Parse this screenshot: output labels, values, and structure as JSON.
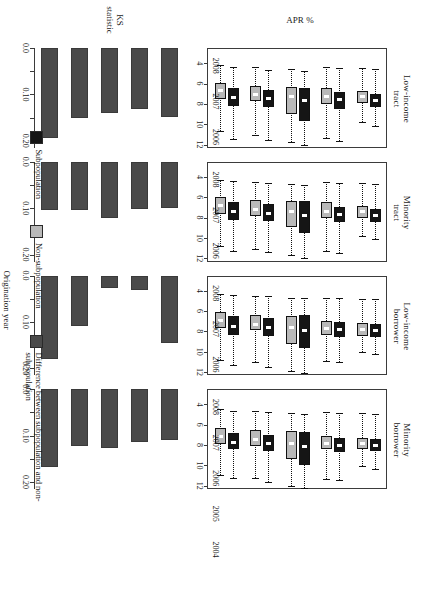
{
  "figure": {
    "orientation": "rotated-90",
    "apr_axis_label": "APR %",
    "ks_axis_label_line1": "KS",
    "ks_axis_label_line2": "statistic",
    "x_axis_label": "Origination year"
  },
  "legend": {
    "items": [
      {
        "label": "Subpopulation",
        "color": "#151515",
        "name": "subpopulation"
      },
      {
        "label": "Non-subpopulation",
        "color": "#b9b9b9",
        "name": "non-subpopulation"
      },
      {
        "label": "Difference between subpopulation and non-subpopulation",
        "color": "#4a4a4a",
        "name": "difference"
      }
    ]
  },
  "chart_data": {
    "type": "bar",
    "composite": "boxplot-over-bar, 4 column groups x 2 rows",
    "categories": [
      "2004",
      "2005",
      "2006",
      "2007",
      "2008"
    ],
    "apr_ticks": [
      4,
      6,
      8,
      10,
      12
    ],
    "apr_axis_range": [
      3.2,
      13.0
    ],
    "apr_ylabel": "APR %",
    "ks_ticks": [
      0.0,
      0.05,
      0.1,
      0.15,
      0.2
    ],
    "ks_tick_labels": [
      "0.0",
      "",
      "0.10",
      "",
      "0.20"
    ],
    "ks_axis_range": [
      0.0,
      0.215
    ],
    "ks_ylabel": "KS statistic",
    "xlabel": "Origination year",
    "grid": false,
    "legend_position": "bottom",
    "panels": [
      {
        "title_line1": "Low-income",
        "title_line2": "tract",
        "boxplot": {
          "series": [
            {
              "name": "Subpopulation",
              "color": "#151515",
              "boxes": [
                {
                  "year": "2004",
                  "whisker_low": 5.0,
                  "q1": 7.0,
                  "median": 8.0,
                  "q3": 8.8,
                  "whisker_high": 12.0
                },
                {
                  "year": "2005",
                  "whisker_low": 5.3,
                  "q1": 7.2,
                  "median": 8.1,
                  "q3": 8.9,
                  "whisker_high": 12.1
                },
                {
                  "year": "2006",
                  "whisker_low": 5.4,
                  "q1": 7.0,
                  "median": 8.3,
                  "q3": 10.3,
                  "whisker_high": 12.6
                },
                {
                  "year": "2007",
                  "whisker_low": 5.1,
                  "q1": 7.4,
                  "median": 8.2,
                  "q3": 9.1,
                  "whisker_high": 12.2
                },
                {
                  "year": "2008",
                  "whisker_low": 5.2,
                  "q1": 7.6,
                  "median": 8.3,
                  "q3": 8.9,
                  "whisker_high": 10.8
                }
              ]
            },
            {
              "name": "Non-subpopulation",
              "color": "#b9b9b9",
              "boxes": [
                {
                  "year": "2004",
                  "whisker_low": 4.8,
                  "q1": 6.5,
                  "median": 7.3,
                  "q3": 8.1,
                  "whisker_high": 11.3
                },
                {
                  "year": "2005",
                  "whisker_low": 5.0,
                  "q1": 6.8,
                  "median": 7.7,
                  "q3": 8.3,
                  "whisker_high": 11.6
                },
                {
                  "year": "2006",
                  "whisker_low": 5.2,
                  "q1": 6.9,
                  "median": 7.9,
                  "q3": 9.6,
                  "whisker_high": 12.3
                },
                {
                  "year": "2007",
                  "whisker_low": 5.0,
                  "q1": 7.0,
                  "median": 7.9,
                  "q3": 8.6,
                  "whisker_high": 11.9
                },
                {
                  "year": "2008",
                  "whisker_low": 5.1,
                  "q1": 7.3,
                  "median": 7.9,
                  "q3": 8.5,
                  "whisker_high": 10.4
                }
              ]
            }
          ]
        },
        "bars": {
          "name": "KS statistic",
          "color": "#4a4a4a",
          "values": [
            0.195,
            0.15,
            0.14,
            0.132,
            0.148
          ]
        }
      },
      {
        "title_line1": "Minority",
        "title_line2": "tract",
        "boxplot": {
          "series": [
            {
              "name": "Subpopulation",
              "color": "#151515",
              "boxes": [
                {
                  "year": "2004",
                  "whisker_low": 5.0,
                  "q1": 7.1,
                  "median": 8.0,
                  "q3": 8.8,
                  "whisker_high": 11.9
                },
                {
                  "year": "2005",
                  "whisker_low": 5.2,
                  "q1": 7.3,
                  "median": 8.2,
                  "q3": 8.9,
                  "whisker_high": 12.0
                },
                {
                  "year": "2006",
                  "whisker_low": 5.4,
                  "q1": 7.0,
                  "median": 8.4,
                  "q3": 10.1,
                  "whisker_high": 12.6
                },
                {
                  "year": "2007",
                  "whisker_low": 5.2,
                  "q1": 7.5,
                  "median": 8.3,
                  "q3": 9.0,
                  "whisker_high": 12.1
                },
                {
                  "year": "2008",
                  "whisker_low": 5.3,
                  "q1": 7.7,
                  "median": 8.4,
                  "q3": 9.0,
                  "whisker_high": 10.7
                }
              ]
            },
            {
              "name": "Non-subpopulation",
              "color": "#b9b9b9",
              "boxes": [
                {
                  "year": "2004",
                  "whisker_low": 4.9,
                  "q1": 6.6,
                  "median": 7.4,
                  "q3": 8.2,
                  "whisker_high": 11.4
                },
                {
                  "year": "2005",
                  "whisker_low": 5.1,
                  "q1": 6.9,
                  "median": 7.8,
                  "q3": 8.4,
                  "whisker_high": 11.7
                },
                {
                  "year": "2006",
                  "whisker_low": 5.3,
                  "q1": 7.0,
                  "median": 8.0,
                  "q3": 9.5,
                  "whisker_high": 12.3
                },
                {
                  "year": "2007",
                  "whisker_low": 5.1,
                  "q1": 7.1,
                  "median": 8.0,
                  "q3": 8.6,
                  "whisker_high": 11.9
                },
                {
                  "year": "2008",
                  "whisker_low": 5.2,
                  "q1": 7.4,
                  "median": 8.0,
                  "q3": 8.6,
                  "whisker_high": 10.4
                }
              ]
            }
          ]
        },
        "bars": {
          "name": "KS statistic",
          "color": "#4a4a4a",
          "values": [
            0.103,
            0.104,
            0.121,
            0.102,
            0.1
          ]
        }
      },
      {
        "title_line1": "Low-income",
        "title_line2": "borrower",
        "boxplot": {
          "series": [
            {
              "name": "Subpopulation",
              "color": "#151515",
              "boxes": [
                {
                  "year": "2004",
                  "whisker_low": 5.0,
                  "q1": 7.1,
                  "median": 8.1,
                  "q3": 8.9,
                  "whisker_high": 11.9
                },
                {
                  "year": "2005",
                  "whisker_low": 5.1,
                  "q1": 7.3,
                  "median": 8.2,
                  "q3": 9.0,
                  "whisker_high": 12.1
                },
                {
                  "year": "2006",
                  "whisker_low": 5.3,
                  "q1": 7.0,
                  "median": 8.5,
                  "q3": 10.2,
                  "whisker_high": 12.7
                },
                {
                  "year": "2007",
                  "whisker_low": 5.3,
                  "q1": 7.7,
                  "median": 8.4,
                  "q3": 9.1,
                  "whisker_high": 11.6
                },
                {
                  "year": "2008",
                  "whisker_low": 5.4,
                  "q1": 7.9,
                  "median": 8.5,
                  "q3": 9.1,
                  "whisker_high": 10.8
                }
              ]
            },
            {
              "name": "Non-subpopulation",
              "color": "#b9b9b9",
              "boxes": [
                {
                  "year": "2004",
                  "whisker_low": 4.9,
                  "q1": 6.7,
                  "median": 7.5,
                  "q3": 8.3,
                  "whisker_high": 11.4
                },
                {
                  "year": "2005",
                  "whisker_low": 5.1,
                  "q1": 7.0,
                  "median": 7.9,
                  "q3": 8.5,
                  "whisker_high": 11.6
                },
                {
                  "year": "2006",
                  "whisker_low": 5.3,
                  "q1": 7.1,
                  "median": 8.2,
                  "q3": 9.8,
                  "whisker_high": 12.5
                },
                {
                  "year": "2007",
                  "whisker_low": 5.3,
                  "q1": 7.6,
                  "median": 8.3,
                  "q3": 8.9,
                  "whisker_high": 11.5
                },
                {
                  "year": "2008",
                  "whisker_low": 5.4,
                  "q1": 7.8,
                  "median": 8.4,
                  "q3": 9.0,
                  "whisker_high": 10.6
                }
              ]
            }
          ]
        },
        "bars": {
          "name": "KS statistic",
          "color": "#4a4a4a",
          "values": [
            0.18,
            0.108,
            0.028,
            0.032,
            0.145
          ]
        }
      },
      {
        "title_line1": "Minority",
        "title_line2": "borrower",
        "boxplot": {
          "series": [
            {
              "name": "Subpopulation",
              "color": "#151515",
              "boxes": [
                {
                  "year": "2004",
                  "whisker_low": 5.2,
                  "q1": 7.4,
                  "median": 8.3,
                  "q3": 9.0,
                  "whisker_high": 11.8
                },
                {
                  "year": "2005",
                  "whisker_low": 5.3,
                  "q1": 7.6,
                  "median": 8.4,
                  "q3": 9.2,
                  "whisker_high": 12.2
                },
                {
                  "year": "2006",
                  "whisker_low": 5.5,
                  "q1": 7.3,
                  "median": 8.7,
                  "q3": 10.5,
                  "whisker_high": 12.8
                },
                {
                  "year": "2007",
                  "whisker_low": 5.4,
                  "q1": 7.9,
                  "median": 8.6,
                  "q3": 9.3,
                  "whisker_high": 12.0
                },
                {
                  "year": "2008",
                  "whisker_low": 5.5,
                  "q1": 8.0,
                  "median": 8.6,
                  "q3": 9.2,
                  "whisker_high": 10.9
                }
              ]
            },
            {
              "name": "Non-subpopulation",
              "color": "#b9b9b9",
              "boxes": [
                {
                  "year": "2004",
                  "whisker_low": 5.0,
                  "q1": 6.9,
                  "median": 7.7,
                  "q3": 8.5,
                  "whisker_high": 11.5
                },
                {
                  "year": "2005",
                  "whisker_low": 5.2,
                  "q1": 7.1,
                  "median": 8.0,
                  "q3": 8.7,
                  "whisker_high": 11.8
                },
                {
                  "year": "2006",
                  "whisker_low": 5.4,
                  "q1": 7.2,
                  "median": 8.4,
                  "q3": 10.0,
                  "whisker_high": 12.6
                },
                {
                  "year": "2007",
                  "whisker_low": 5.3,
                  "q1": 7.7,
                  "median": 8.4,
                  "q3": 9.0,
                  "whisker_high": 11.9
                },
                {
                  "year": "2008",
                  "whisker_low": 5.4,
                  "q1": 7.9,
                  "median": 8.4,
                  "q3": 9.0,
                  "whisker_high": 10.6
                }
              ]
            }
          ]
        },
        "bars": {
          "name": "KS statistic",
          "color": "#4a4a4a",
          "values": [
            0.168,
            0.122,
            0.127,
            0.113,
            0.11
          ]
        }
      }
    ]
  }
}
